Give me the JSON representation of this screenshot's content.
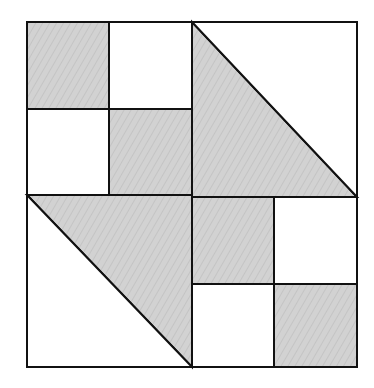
{
  "diagram": {
    "colors": {
      "background": "#ffffff",
      "shade": "#d0d0d0",
      "stripe": "#c2c2c2",
      "stroke": "#111111"
    },
    "outer_square": {
      "x1": 27,
      "y1": 22,
      "x2": 357,
      "y2": 367
    },
    "center": {
      "x": 192,
      "y": 195
    },
    "shapes": [
      {
        "id": "tl-tl",
        "type": "rect",
        "shaded": true,
        "points": [
          [
            27,
            22
          ],
          [
            109,
            22
          ],
          [
            109,
            109
          ],
          [
            27,
            109
          ]
        ]
      },
      {
        "id": "tl-tr",
        "type": "rect",
        "shaded": false,
        "points": [
          [
            109,
            22
          ],
          [
            192,
            22
          ],
          [
            192,
            109
          ],
          [
            109,
            109
          ]
        ]
      },
      {
        "id": "tl-bl",
        "type": "rect",
        "shaded": false,
        "points": [
          [
            27,
            109
          ],
          [
            109,
            109
          ],
          [
            109,
            195
          ],
          [
            27,
            195
          ]
        ]
      },
      {
        "id": "tl-br",
        "type": "rect",
        "shaded": true,
        "points": [
          [
            109,
            109
          ],
          [
            192,
            109
          ],
          [
            192,
            195
          ],
          [
            109,
            195
          ]
        ]
      },
      {
        "id": "tr-lower",
        "type": "triangle",
        "shaded": true,
        "points": [
          [
            192,
            22
          ],
          [
            357,
            197
          ],
          [
            192,
            197
          ]
        ]
      },
      {
        "id": "tr-upper",
        "type": "triangle",
        "shaded": false,
        "points": [
          [
            192,
            22
          ],
          [
            357,
            22
          ],
          [
            357,
            197
          ]
        ]
      },
      {
        "id": "bl-upper",
        "type": "triangle",
        "shaded": true,
        "points": [
          [
            27,
            195
          ],
          [
            192,
            195
          ],
          [
            192,
            367
          ]
        ]
      },
      {
        "id": "bl-lower",
        "type": "triangle",
        "shaded": false,
        "points": [
          [
            27,
            195
          ],
          [
            192,
            367
          ],
          [
            27,
            367
          ]
        ]
      },
      {
        "id": "br-tl",
        "type": "rect",
        "shaded": true,
        "points": [
          [
            192,
            197
          ],
          [
            274,
            197
          ],
          [
            274,
            284
          ],
          [
            192,
            284
          ]
        ]
      },
      {
        "id": "br-tr",
        "type": "rect",
        "shaded": false,
        "points": [
          [
            274,
            197
          ],
          [
            357,
            197
          ],
          [
            357,
            284
          ],
          [
            274,
            284
          ]
        ]
      },
      {
        "id": "br-bl",
        "type": "rect",
        "shaded": false,
        "points": [
          [
            192,
            284
          ],
          [
            274,
            284
          ],
          [
            274,
            367
          ],
          [
            192,
            367
          ]
        ]
      },
      {
        "id": "br-br",
        "type": "rect",
        "shaded": true,
        "points": [
          [
            274,
            284
          ],
          [
            357,
            284
          ],
          [
            357,
            367
          ],
          [
            274,
            367
          ]
        ]
      }
    ]
  }
}
